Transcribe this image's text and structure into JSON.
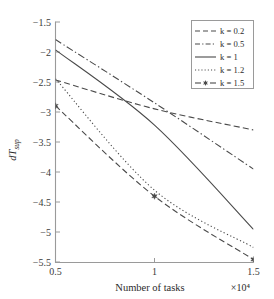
{
  "chart_data": {
    "type": "line",
    "title": "",
    "xlabel": "Number of tasks",
    "ylabel": "dT_sup",
    "x_exponent_label": "×10⁴",
    "xlim": [
      0.5,
      1.5
    ],
    "ylim": [
      -5.5,
      -1.5
    ],
    "xticks": [
      0.5,
      1,
      1.5
    ],
    "xtick_labels": [
      "0.5",
      "1",
      "1.5"
    ],
    "yticks": [
      -1.5,
      -2,
      -2.5,
      -3,
      -3.5,
      -4,
      -4.5,
      -5,
      -5.5
    ],
    "ytick_labels": [
      "−1.5",
      "−2",
      "−2.5",
      "−3",
      "−3.5",
      "−4",
      "−4.5",
      "−5",
      "−5.5"
    ],
    "grid": false,
    "legend_position": "top-right",
    "x": [
      0.5,
      1.0,
      1.5
    ],
    "series": [
      {
        "name": "k = 0.2",
        "k": 0.2,
        "style": "dashed",
        "marker": "none",
        "color": "#4a4a4a",
        "values": [
          -2.47,
          -2.95,
          -3.3
        ]
      },
      {
        "name": "k = 0.5",
        "k": 0.5,
        "style": "dashdot",
        "marker": "none",
        "color": "#4a4a4a",
        "values": [
          -1.8,
          -2.85,
          -3.95
        ]
      },
      {
        "name": "k = 1",
        "k": 1,
        "style": "solid",
        "marker": "none",
        "color": "#4a4a4a",
        "values": [
          -1.97,
          -3.22,
          -4.95
        ]
      },
      {
        "name": "k = 1.2",
        "k": 1.2,
        "style": "dotted",
        "marker": "none",
        "color": "#4a4a4a",
        "values": [
          -2.45,
          -4.3,
          -5.25
        ]
      },
      {
        "name": "k = 1.5",
        "k": 1.5,
        "style": "dashed",
        "marker": "star",
        "color": "#4a4a4a",
        "values": [
          -2.9,
          -4.4,
          -5.45
        ]
      }
    ]
  },
  "legend": {
    "items": [
      {
        "label": "k = 0.2"
      },
      {
        "label": "k = 0.5"
      },
      {
        "label": "k = 1"
      },
      {
        "label": "k = 1.2"
      },
      {
        "label": "k = 1.5"
      }
    ]
  },
  "axes": {
    "x_title": "Number of tasks",
    "x_exponent": "×10⁴",
    "y_title_main": "dT",
    "y_title_sub": "sup"
  }
}
